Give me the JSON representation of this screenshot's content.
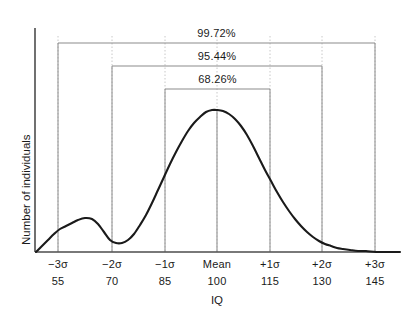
{
  "chart_data": {
    "type": "line",
    "title": "",
    "xlabel": "IQ",
    "ylabel": "Number of individuals",
    "grid": true,
    "legend": "none",
    "xlim": [
      40,
      152
    ],
    "ylim": [
      0,
      1.05
    ],
    "sigma_ticks": [
      {
        "sigma": "−3σ",
        "iq": "55",
        "x_px": 58
      },
      {
        "sigma": "−2σ",
        "iq": "70",
        "x_px": 112
      },
      {
        "sigma": "−1σ",
        "iq": "85",
        "x_px": 165
      },
      {
        "sigma": "Mean",
        "iq": "100",
        "x_px": 217
      },
      {
        "sigma": "+1σ",
        "iq": "115",
        "x_px": 270
      },
      {
        "sigma": "+2σ",
        "iq": "130",
        "x_px": 322
      },
      {
        "sigma": "+3σ",
        "iq": "145",
        "x_px": 375
      }
    ],
    "brackets": [
      {
        "label": "99.72%",
        "from": "−3σ",
        "to": "+3σ",
        "x1_px": 58,
        "x2_px": 375,
        "y_px": 43
      },
      {
        "label": "95.44%",
        "from": "−2σ",
        "to": "+2σ",
        "x1_px": 112,
        "x2_px": 322,
        "y_px": 66
      },
      {
        "label": "68.26%",
        "from": "−1σ",
        "to": "+1σ",
        "x1_px": 165,
        "x2_px": 270,
        "y_px": 89
      }
    ],
    "series": [
      {
        "name": "IQ distribution",
        "description": "Bimodal distribution: main normal peak at Mean (IQ 100) with a small secondary bump near IQ 62",
        "points_px": [
          [
            36,
            252
          ],
          [
            42,
            246
          ],
          [
            48,
            240
          ],
          [
            54,
            234
          ],
          [
            60,
            229
          ],
          [
            66,
            226
          ],
          [
            72,
            223
          ],
          [
            78,
            220
          ],
          [
            85,
            218
          ],
          [
            92,
            219
          ],
          [
            98,
            224
          ],
          [
            104,
            232
          ],
          [
            110,
            240
          ],
          [
            116,
            243
          ],
          [
            122,
            243
          ],
          [
            128,
            240
          ],
          [
            134,
            234
          ],
          [
            140,
            225
          ],
          [
            146,
            215
          ],
          [
            152,
            203
          ],
          [
            158,
            190
          ],
          [
            164,
            177
          ],
          [
            170,
            164
          ],
          [
            176,
            152
          ],
          [
            182,
            141
          ],
          [
            188,
            131
          ],
          [
            194,
            123
          ],
          [
            200,
            117
          ],
          [
            206,
            112
          ],
          [
            212,
            110
          ],
          [
            217,
            110
          ],
          [
            223,
            111
          ],
          [
            229,
            114
          ],
          [
            235,
            119
          ],
          [
            241,
            126
          ],
          [
            247,
            135
          ],
          [
            253,
            146
          ],
          [
            259,
            158
          ],
          [
            265,
            170
          ],
          [
            271,
            181
          ],
          [
            277,
            192
          ],
          [
            283,
            202
          ],
          [
            289,
            211
          ],
          [
            295,
            219
          ],
          [
            301,
            226
          ],
          [
            307,
            232
          ],
          [
            313,
            237
          ],
          [
            319,
            241
          ],
          [
            325,
            244
          ],
          [
            331,
            246
          ],
          [
            337,
            248
          ],
          [
            343,
            249
          ],
          [
            350,
            250
          ],
          [
            358,
            251
          ],
          [
            366,
            251
          ],
          [
            376,
            252
          ],
          [
            388,
            252
          ],
          [
            400,
            252
          ]
        ]
      }
    ],
    "mean_line": {
      "x_px": 217,
      "y_top_px": 110,
      "y_bottom_px": 252
    }
  },
  "axes": {
    "y_axis_label": "Number of individuals",
    "x_axis_label": "IQ"
  },
  "colors": {
    "curve": "#1a1a1a",
    "axis": "#4d4d4d",
    "bracket": "#8c8c8c",
    "gridline": "#c8c8c8",
    "mean_line": "#9a9a9a",
    "text": "#1a1a1a",
    "background": "#ffffff"
  }
}
